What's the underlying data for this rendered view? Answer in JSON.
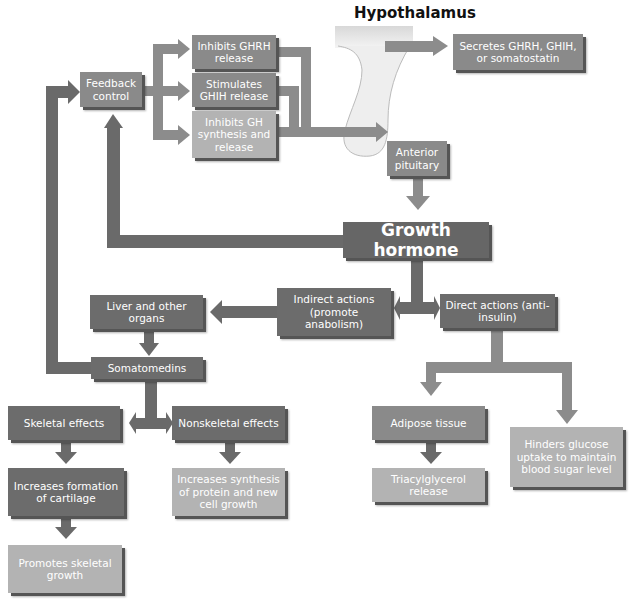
{
  "title": "Hypothalamus",
  "nodes": {
    "secretes": "Secretes GHRH, GHIH, or somatostatin",
    "feedback": "Feedback control",
    "inhibits_ghrh": "Inhibits GHRH release",
    "stimulates_ghih": "Stimulates GHIH release",
    "inhibits_gh": "Inhibits GH synthesis and release",
    "anterior_pituitary": "Anterior pituitary",
    "growth_hormone": "Growth hormone",
    "indirect_actions": "Indirect actions (promote anabolism)",
    "direct_actions": "Direct actions (anti-insulin)",
    "liver": "Liver and other organs",
    "somatomedins": "Somatomedins",
    "skeletal_effects": "Skeletal effects",
    "nonskeletal_effects": "Nonskeletal effects",
    "cartilage": "Increases formation of cartilage",
    "skeletal_growth": "Promotes skeletal growth",
    "protein_synthesis": "Increases synthesis of protein and new cell growth",
    "adipose": "Adipose tissue",
    "triacylglycerol": "Triacylglycerol release",
    "hinders_glucose": "Hinders glucose uptake to maintain blood sugar level"
  },
  "colors": {
    "dark_box": "#6c6c6c",
    "mid_box": "#8a8a8a",
    "light_box": "#b3b3b3",
    "arrow": "#6a6a6a",
    "arrow_light": "#8c8c8c"
  }
}
